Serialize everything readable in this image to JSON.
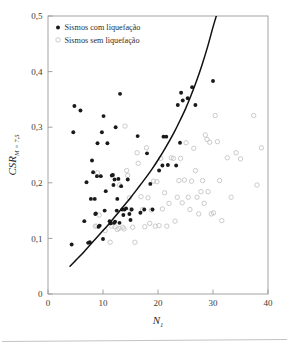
{
  "chart_data": {
    "type": "scatter",
    "title": "",
    "xlabel": "N_1",
    "xlabel_base": "N",
    "xlabel_sub": "1",
    "ylabel_base": "CSR",
    "ylabel_sub": "M = 7,5",
    "xlim": [
      0,
      40
    ],
    "ylim": [
      0,
      0.5
    ],
    "grid": false,
    "decimal_separator": ",",
    "xticks": [
      0,
      10,
      20,
      30,
      40
    ],
    "xtick_labels": [
      "0",
      "10",
      "20",
      "30",
      "40"
    ],
    "yticks": [
      0,
      0.1,
      0.2,
      0.3,
      0.4,
      0.5
    ],
    "ytick_labels": [
      "0",
      "0,1",
      "0,2",
      "0,3",
      "0,4",
      "0,5"
    ],
    "legend_position": "top-left",
    "series": [
      {
        "name": "Sismos com liquefação",
        "marker": "filled-circle",
        "color": "#1a1a1a",
        "points": [
          [
            4.3,
            0.089
          ],
          [
            4.6,
            0.291
          ],
          [
            4.8,
            0.338
          ],
          [
            5.9,
            0.33
          ],
          [
            6.6,
            0.131
          ],
          [
            7.0,
            0.201
          ],
          [
            7.3,
            0.092
          ],
          [
            7.6,
            0.093
          ],
          [
            7.8,
            0.171
          ],
          [
            8.0,
            0.24
          ],
          [
            8.2,
            0.219
          ],
          [
            8.5,
            0.171
          ],
          [
            8.6,
            0.144
          ],
          [
            8.7,
            0.145
          ],
          [
            8.9,
            0.212
          ],
          [
            9.0,
            0.271
          ],
          [
            9.2,
            0.121
          ],
          [
            9.4,
            0.123
          ],
          [
            9.6,
            0.212
          ],
          [
            9.8,
            0.291
          ],
          [
            10.0,
            0.099
          ],
          [
            10.1,
            0.32
          ],
          [
            10.3,
            0.15
          ],
          [
            10.5,
            0.185
          ],
          [
            10.8,
            0.271
          ],
          [
            11.2,
            0.131
          ],
          [
            11.4,
            0.127
          ],
          [
            11.6,
            0.213
          ],
          [
            11.8,
            0.214
          ],
          [
            11.9,
            0.196
          ],
          [
            12.0,
            0.128
          ],
          [
            12.1,
            0.206
          ],
          [
            12.2,
            0.13
          ],
          [
            12.3,
            0.3
          ],
          [
            12.5,
            0.15
          ],
          [
            12.6,
            0.171
          ],
          [
            12.8,
            0.207
          ],
          [
            13.0,
            0.128
          ],
          [
            13.1,
            0.36
          ],
          [
            13.3,
            0.194
          ],
          [
            13.5,
            0.152
          ],
          [
            13.7,
            0.142
          ],
          [
            13.9,
            0.152
          ],
          [
            14.2,
            0.154
          ],
          [
            14.5,
            0.206
          ],
          [
            14.8,
            0.144
          ],
          [
            15.0,
            0.133
          ],
          [
            15.2,
            0.152
          ],
          [
            16.3,
            0.284
          ],
          [
            16.8,
            0.146
          ],
          [
            17.5,
            0.152
          ],
          [
            18.0,
            0.253
          ],
          [
            18.6,
            0.198
          ],
          [
            19.0,
            0.152
          ],
          [
            20.2,
            0.222
          ],
          [
            20.8,
            0.231
          ],
          [
            21.0,
            0.283
          ],
          [
            21.5,
            0.283
          ],
          [
            21.8,
            0.232
          ],
          [
            23.3,
            0.231
          ],
          [
            23.6,
            0.34
          ],
          [
            24.0,
            0.272
          ],
          [
            24.2,
            0.362
          ],
          [
            24.5,
            0.348
          ],
          [
            25.4,
            0.352
          ],
          [
            26.2,
            0.372
          ],
          [
            26.8,
            0.34
          ],
          [
            30.0,
            0.383
          ]
        ]
      },
      {
        "name": "Sismos sem liquefação",
        "marker": "open-circle",
        "color": "#c2c2c2",
        "points": [
          [
            8.6,
            0.122
          ],
          [
            8.9,
            0.122
          ],
          [
            9.0,
            0.218
          ],
          [
            9.3,
            0.142
          ],
          [
            10.4,
            0.114
          ],
          [
            11.3,
            0.093
          ],
          [
            11.6,
            0.122
          ],
          [
            12.2,
            0.121
          ],
          [
            12.6,
            0.116
          ],
          [
            12.9,
            0.118
          ],
          [
            13.0,
            0.196
          ],
          [
            13.6,
            0.12
          ],
          [
            13.8,
            0.117
          ],
          [
            14.0,
            0.302
          ],
          [
            14.3,
            0.222
          ],
          [
            14.5,
            0.213
          ],
          [
            14.8,
            0.173
          ],
          [
            15.1,
            0.152
          ],
          [
            15.4,
            0.12
          ],
          [
            15.8,
            0.093
          ],
          [
            16.2,
            0.254
          ],
          [
            16.4,
            0.235
          ],
          [
            16.9,
            0.175
          ],
          [
            17.2,
            0.152
          ],
          [
            17.6,
            0.121
          ],
          [
            17.9,
            0.263
          ],
          [
            18.2,
            0.173
          ],
          [
            18.5,
            0.127
          ],
          [
            18.8,
            0.151
          ],
          [
            19.2,
            0.203
          ],
          [
            19.5,
            0.122
          ],
          [
            19.8,
            0.202
          ],
          [
            20.2,
            0.123
          ],
          [
            20.5,
            0.244
          ],
          [
            20.8,
            0.153
          ],
          [
            21.2,
            0.182
          ],
          [
            21.6,
            0.122
          ],
          [
            22.0,
            0.163
          ],
          [
            22.4,
            0.245
          ],
          [
            22.8,
            0.244
          ],
          [
            23.1,
            0.131
          ],
          [
            23.5,
            0.174
          ],
          [
            23.8,
            0.204
          ],
          [
            24.1,
            0.244
          ],
          [
            24.4,
            0.164
          ],
          [
            24.8,
            0.205
          ],
          [
            25.1,
            0.272
          ],
          [
            25.5,
            0.174
          ],
          [
            25.8,
            0.152
          ],
          [
            26.1,
            0.203
          ],
          [
            26.5,
            0.262
          ],
          [
            26.8,
            0.222
          ],
          [
            27.1,
            0.174
          ],
          [
            27.4,
            0.144
          ],
          [
            27.8,
            0.184
          ],
          [
            28.1,
            0.204
          ],
          [
            28.4,
            0.163
          ],
          [
            28.6,
            0.286
          ],
          [
            28.9,
            0.278
          ],
          [
            29.1,
            0.184
          ],
          [
            29.4,
            0.273
          ],
          [
            29.7,
            0.144
          ],
          [
            30.1,
            0.146
          ],
          [
            30.4,
            0.321
          ],
          [
            30.8,
            0.274
          ],
          [
            31.2,
            0.204
          ],
          [
            31.6,
            0.132
          ],
          [
            32.6,
            0.245
          ],
          [
            33.3,
            0.174
          ],
          [
            34.2,
            0.254
          ],
          [
            35.0,
            0.243
          ],
          [
            37.4,
            0.321
          ],
          [
            38.0,
            0.196
          ],
          [
            38.8,
            0.263
          ]
        ]
      }
    ],
    "curve": {
      "name": "boundary-curve",
      "color": "#111111",
      "points": [
        [
          4.0,
          0.05
        ],
        [
          5.0,
          0.06
        ],
        [
          6.0,
          0.07
        ],
        [
          7.0,
          0.081
        ],
        [
          8.0,
          0.092
        ],
        [
          9.0,
          0.103
        ],
        [
          10.0,
          0.114
        ],
        [
          11.0,
          0.125
        ],
        [
          12.0,
          0.137
        ],
        [
          13.0,
          0.149
        ],
        [
          14.0,
          0.161
        ],
        [
          15.0,
          0.173
        ],
        [
          16.0,
          0.186
        ],
        [
          17.0,
          0.199
        ],
        [
          18.0,
          0.212
        ],
        [
          19.0,
          0.226
        ],
        [
          20.0,
          0.241
        ],
        [
          21.0,
          0.257
        ],
        [
          22.0,
          0.274
        ],
        [
          23.0,
          0.292
        ],
        [
          24.0,
          0.312
        ],
        [
          25.0,
          0.333
        ],
        [
          26.0,
          0.357
        ],
        [
          27.0,
          0.383
        ],
        [
          28.0,
          0.412
        ],
        [
          29.0,
          0.444
        ],
        [
          30.0,
          0.48
        ],
        [
          30.6,
          0.5
        ]
      ]
    }
  },
  "legend": {
    "entries": [
      {
        "label": "Sismos com liquefação",
        "marker": "filled-circle"
      },
      {
        "label": "Sismos sem liquefação",
        "marker": "open-circle"
      }
    ]
  }
}
